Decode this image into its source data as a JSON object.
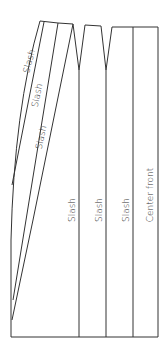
{
  "diagram": {
    "stroke_color": "#333333",
    "background": "#ffffff",
    "labels": {
      "fan_slash_1": "Slash",
      "fan_slash_2": "Slash",
      "fan_slash_3": "Slash",
      "vertical_slash_1": "Slash",
      "vertical_slash_2": "Slash",
      "vertical_slash_3": "Slash",
      "center_front": "Center front"
    }
  }
}
